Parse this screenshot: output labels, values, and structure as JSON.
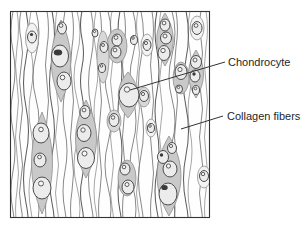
{
  "figure": {
    "labels": {
      "chondrocyte": "Chondrocyte",
      "collagen_fibers": "Collagen fibers"
    },
    "palette": {
      "ink": "#333333",
      "fiber_gray": "#6b6b6b",
      "lacuna_gray": "#c9c9c9",
      "cell_fill": "#ececec",
      "background": "#ffffff"
    }
  }
}
